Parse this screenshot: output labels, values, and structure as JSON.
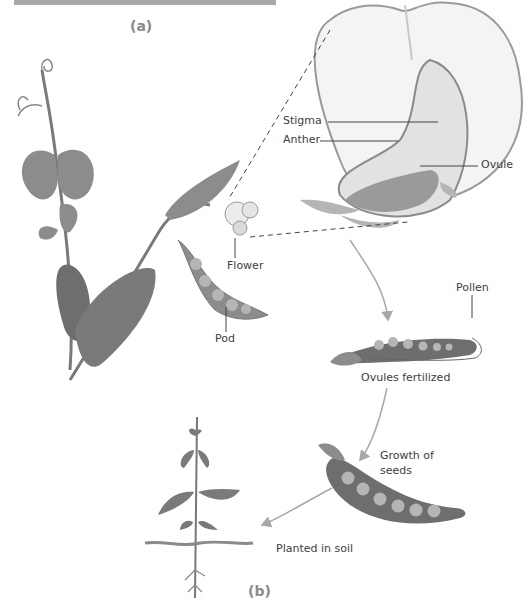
{
  "figure": {
    "panel_a_label": "(a)",
    "panel_b_label": "(b)"
  },
  "labels": {
    "stigma": "Stigma",
    "anther": "Anther",
    "ovule": "Ovule",
    "flower": "Flower",
    "pod": "Pod",
    "pollen": "Pollen",
    "ovules_fertilized": "Ovules fertilized",
    "growth_of_seeds_line1": "Growth of",
    "growth_of_seeds_line2": "seeds",
    "planted_in_soil": "Planted in soil"
  },
  "colors": {
    "leaf": "#8c8c8c",
    "leaf_dark": "#6e6e6e",
    "pod": "#7a7a7a",
    "pea": "#b5b5b5",
    "arrow": "#a8a8a8",
    "text": "#3e3e3e"
  }
}
